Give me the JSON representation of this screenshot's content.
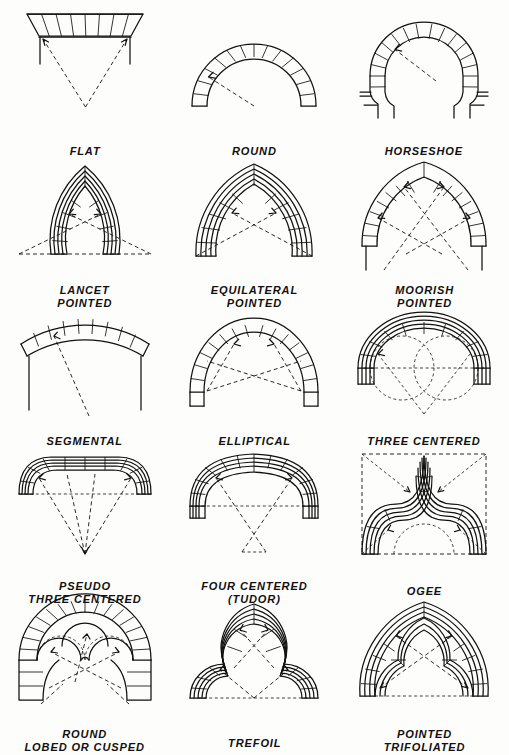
{
  "plate": {
    "title": "Types of Arches",
    "background_color": "#fdfdfb",
    "line_color": "#111111",
    "columns": 3,
    "rows": 5
  },
  "figures": [
    {
      "id": "flat",
      "label_line1": "FLAT",
      "label_line2": "",
      "row": 1,
      "col": 1,
      "shape": "flat-arch",
      "description": "Flat trapezoidal arch with radiating voussoir joints converging to a point below; dashed construction lines from each springing arrow down to the common center.",
      "voussoirs": 8,
      "construction_lines": "two dashed lines with arrowheads meeting at a single center point below the arch",
      "has_piers": true
    },
    {
      "id": "round",
      "label_line1": "ROUND",
      "label_line2": "",
      "row": 1,
      "col": 2,
      "shape": "semicircular",
      "description": "Semicircular round arch of voussoirs with a single dashed radius line and arrow pointing from the center to the intrados.",
      "voussoirs": 13,
      "construction_lines": "one dashed radius with arrowhead at the intrados",
      "has_piers": false
    },
    {
      "id": "horseshoe",
      "label_line1": "HORSESHOE",
      "label_line2": "",
      "row": 1,
      "col": 3,
      "shape": "horseshoe",
      "description": "Arch struck from a center above the springing so the curve returns inward below the diameter; imposts marked with horizontal joint lines.",
      "voussoirs": 16,
      "construction_lines": "one dashed radius with arrowhead",
      "has_piers": true
    },
    {
      "id": "lancet-pointed",
      "label_line1": "LANCET",
      "label_line2": "POINTED",
      "row": 2,
      "col": 1,
      "shape": "pointed-lancet",
      "description": "Tall narrow two-centered pointed arch with four concentric moulding bands; dashed radii cross and extend past the springing line to centers outside the opening.",
      "bands": 4,
      "construction_lines": "two crossing dashed radii with arrowheads, plus dashed springing line extended both ways",
      "has_piers": false
    },
    {
      "id": "equilateral-pointed",
      "label_line1": "EQUILATERAL",
      "label_line2": "POINTED",
      "row": 2,
      "col": 2,
      "shape": "pointed-equilateral",
      "description": "Two-centered pointed arch whose radii equal the span; concentric moulding bands with voussoir joints and crossing dashed radii from the opposite springing points.",
      "bands": 4,
      "construction_lines": "two crossing dashed radii with arrowheads meeting opposite springings",
      "has_piers": false
    },
    {
      "id": "moorish-pointed",
      "label_line1": "MOORISH",
      "label_line2": "POINTED",
      "row": 2,
      "col": 3,
      "shape": "pointed-moorish",
      "description": "Pointed horseshoe arch of large voussoirs; several dashed radii cross below the springing and continue past the label.",
      "voussoirs": 20,
      "construction_lines": "four dashed radii with arrowheads crossing below the arch",
      "has_piers": true
    },
    {
      "id": "segmental",
      "label_line1": "SEGMENTAL",
      "label_line2": "",
      "row": 3,
      "col": 1,
      "shape": "segmental",
      "description": "Shallow segment of a circle springing from two vertical piers; a long dashed radius runs down to a center far below.",
      "voussoirs": 11,
      "construction_lines": "one long dashed radius with arrowhead",
      "has_piers": true
    },
    {
      "id": "elliptical",
      "label_line1": "ELLIPTICAL",
      "label_line2": "",
      "row": 3,
      "col": 2,
      "shape": "elliptical",
      "description": "Half-ellipse arch of voussoirs; dashed focal lines cross between the two foci with arrowheads touching the curve.",
      "voussoirs": 15,
      "construction_lines": "crossed dashed focal lines with arrowheads and a dashed chord",
      "has_piers": false
    },
    {
      "id": "three-centered",
      "label_line1": "THREE CENTERED",
      "label_line2": "",
      "row": 3,
      "col": 3,
      "shape": "three-centered",
      "description": "Flattened arch of three arcs with concentric moulding bands; two dashed construction circles sit below the springing line and dashed lines converge to a low center.",
      "bands": 3,
      "construction_lines": "two dashed circles, dashed springing line, and two dashed lines converging below",
      "has_piers": false
    },
    {
      "id": "pseudo-three-centered",
      "label_line1": "PSEUDO",
      "label_line2": "THREE CENTERED",
      "row": 4,
      "col": 1,
      "shape": "pseudo-three-centered",
      "description": "Nearly flat soffit with quick rounded corners; four dashed lines with arrowheads converge to a single point well below the arch.",
      "bands": 3,
      "construction_lines": "four dashed lines converging to one low point, dashed springing line",
      "has_piers": false
    },
    {
      "id": "four-centered-tudor",
      "label_line1": "FOUR CENTERED",
      "label_line2": "(TUDOR)",
      "row": 4,
      "col": 2,
      "shape": "four-centered",
      "description": "Depressed four-centered Tudor arch with concentric bands and voussoir joints; two dashed radii cross below and run to centers on the springing line.",
      "bands": 3,
      "construction_lines": "two crossing dashed radii with arrowheads and dashed springing line",
      "has_piers": false
    },
    {
      "id": "ogee",
      "label_line1": "OGEE",
      "label_line2": "",
      "row": 4,
      "col": 3,
      "shape": "ogee",
      "description": "Double-curved S-shaped arch rising to a slender point, drawn inside a dashed rectangle with diagonal dashed arrows and a dashed inner semicircle.",
      "bands": 4,
      "construction_lines": "dashed bounding rectangle, two diagonal dashed arrows to the apex, dashed arcs and arrows at the haunches",
      "has_piers": false
    },
    {
      "id": "round-lobed-or-cusped",
      "label_line1": "ROUND",
      "label_line2": "LOBED OR CUSPED",
      "row": 5,
      "col": 1,
      "shape": "round-cusped",
      "description": "Round outer arch with radiating voussoirs enclosing a three-lobed cusped inner profile; dashed radii cross to the lobe centers.",
      "voussoirs": 16,
      "lobes": 3,
      "construction_lines": "crossed dashed radii with arrowheads to each lobe center, dashed lobe arcs",
      "has_piers": true
    },
    {
      "id": "trefoil",
      "label_line1": "TREFOIL",
      "label_line2": "",
      "row": 5,
      "col": 2,
      "shape": "trefoil",
      "description": "Three-lobed trefoil arch with a pointed central lobe and two rounded side lobes in concentric moulding bands; dashed radii with arrowheads mark the lobe centers.",
      "bands": 4,
      "lobes": 3,
      "construction_lines": "two crossing dashed radii to the upper lobe, two dashed lines to the side lobes, dashed springing line",
      "has_piers": false
    },
    {
      "id": "pointed-trifoliated",
      "label_line1": "POINTED",
      "label_line2": "TRIFOLIATED",
      "row": 5,
      "col": 3,
      "shape": "pointed-trifoliated",
      "description": "Pointed two-centered arch with trefoil cusping worked into the inner order; dashed radii cross the opening with arrowheads at the cusps.",
      "bands": 4,
      "lobes": 3,
      "construction_lines": "crossing dashed radii with arrowheads and dashed springing line",
      "has_piers": false
    }
  ]
}
